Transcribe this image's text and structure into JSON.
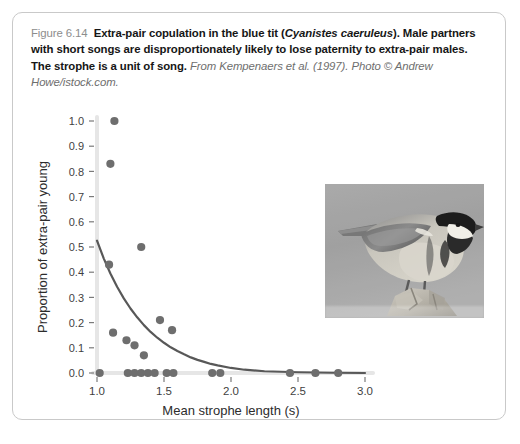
{
  "figure": {
    "number": "Figure 6.14",
    "title_bold_1": "Extra-pair copulation in the blue tit (",
    "title_italic_species": "Cyanistes caeruleus",
    "title_bold_2": "). Male partners with short songs are disproportionately likely to lose paternity to extra-pair males. The strophe is a unit of song.",
    "source": " From Kempenaers et al. (1997). Photo © Andrew Howe/istock.com.",
    "photo_alt": "blue-tit-perched-on-branch-grayscale-photo"
  },
  "chart_data": {
    "type": "scatter",
    "title": "",
    "xlabel": "Mean strophe length (s)",
    "ylabel": "Proportion of extra-pair young",
    "xlim": [
      1.0,
      3.0
    ],
    "ylim": [
      0.0,
      1.0
    ],
    "xticks": [
      1.0,
      1.5,
      2.0,
      2.5,
      3.0
    ],
    "xticklabels": [
      "1.0",
      "1.5",
      "2.0",
      "2.5",
      "3.0"
    ],
    "yticks": [
      0.0,
      0.1,
      0.2,
      0.3,
      0.4,
      0.5,
      0.6,
      0.7,
      0.8,
      0.9,
      1.0
    ],
    "yticklabels": [
      "0.0",
      "0.1",
      "0.2",
      "0.3",
      "0.4",
      "0.5",
      "0.6",
      "0.7",
      "0.8",
      "0.9",
      "1.0"
    ],
    "grid": false,
    "legend": null,
    "point_color": "#6e6e6e",
    "line_color": "#585858",
    "axis_color": "#e6e6e6",
    "points": [
      {
        "x": 1.13,
        "y": 1.0
      },
      {
        "x": 1.1,
        "y": 0.83
      },
      {
        "x": 1.33,
        "y": 0.5
      },
      {
        "x": 1.09,
        "y": 0.43
      },
      {
        "x": 1.12,
        "y": 0.16
      },
      {
        "x": 1.47,
        "y": 0.21
      },
      {
        "x": 1.56,
        "y": 0.17
      },
      {
        "x": 1.22,
        "y": 0.13
      },
      {
        "x": 1.28,
        "y": 0.11
      },
      {
        "x": 1.35,
        "y": 0.07
      },
      {
        "x": 1.02,
        "y": 0.0
      },
      {
        "x": 1.23,
        "y": 0.0
      },
      {
        "x": 1.28,
        "y": 0.0
      },
      {
        "x": 1.33,
        "y": 0.0
      },
      {
        "x": 1.38,
        "y": 0.0
      },
      {
        "x": 1.43,
        "y": 0.0
      },
      {
        "x": 1.52,
        "y": 0.0
      },
      {
        "x": 1.57,
        "y": 0.0
      },
      {
        "x": 1.86,
        "y": 0.0
      },
      {
        "x": 1.92,
        "y": 0.0
      },
      {
        "x": 2.44,
        "y": 0.0
      },
      {
        "x": 2.63,
        "y": 0.0
      },
      {
        "x": 2.8,
        "y": 0.0
      }
    ],
    "fit_curve": {
      "description": "exponential decay fit",
      "points": [
        {
          "x": 1.0,
          "y": 0.525
        },
        {
          "x": 1.05,
          "y": 0.455
        },
        {
          "x": 1.1,
          "y": 0.395
        },
        {
          "x": 1.15,
          "y": 0.342
        },
        {
          "x": 1.2,
          "y": 0.296
        },
        {
          "x": 1.25,
          "y": 0.256
        },
        {
          "x": 1.3,
          "y": 0.221
        },
        {
          "x": 1.35,
          "y": 0.19
        },
        {
          "x": 1.4,
          "y": 0.163
        },
        {
          "x": 1.45,
          "y": 0.14
        },
        {
          "x": 1.5,
          "y": 0.12
        },
        {
          "x": 1.55,
          "y": 0.102
        },
        {
          "x": 1.6,
          "y": 0.087
        },
        {
          "x": 1.65,
          "y": 0.074
        },
        {
          "x": 1.7,
          "y": 0.062
        },
        {
          "x": 1.75,
          "y": 0.052
        },
        {
          "x": 1.8,
          "y": 0.044
        },
        {
          "x": 1.85,
          "y": 0.036
        },
        {
          "x": 1.9,
          "y": 0.03
        },
        {
          "x": 2.0,
          "y": 0.02
        },
        {
          "x": 2.1,
          "y": 0.013
        },
        {
          "x": 2.25,
          "y": 0.007
        },
        {
          "x": 2.5,
          "y": 0.003
        },
        {
          "x": 2.75,
          "y": 0.001
        },
        {
          "x": 3.0,
          "y": 0.0
        }
      ]
    }
  }
}
